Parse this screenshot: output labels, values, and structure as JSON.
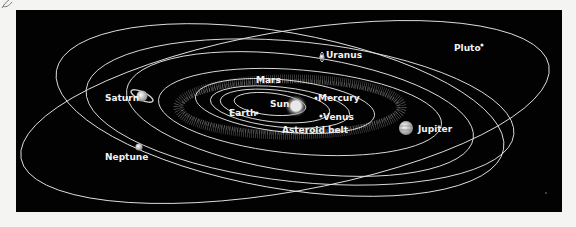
{
  "diagram": {
    "background": "#020202",
    "orbit_color": "#e8e8e8",
    "labels": {
      "sun": "Sun",
      "mercury": "Mercury",
      "venus": "Venus",
      "earth": "Earth",
      "mars": "Mars",
      "asteroid_belt": "Asteroid belt",
      "jupiter": "Jupiter",
      "saturn": "Saturn",
      "uranus": "Uranus",
      "neptune": "Neptune",
      "pluto": "Pluto"
    }
  }
}
